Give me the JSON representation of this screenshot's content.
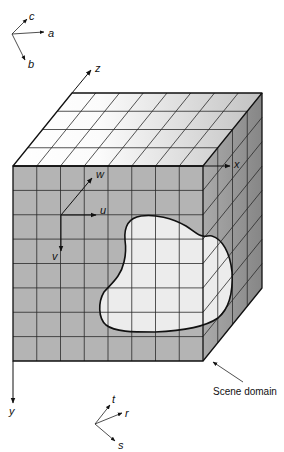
{
  "frames": {
    "abc": {
      "a": "a",
      "b": "b",
      "c": "c"
    },
    "world": {
      "x": "x",
      "y": "y",
      "z": "z"
    },
    "uvw": {
      "u": "u",
      "v": "v",
      "w": "w"
    },
    "rst": {
      "r": "r",
      "s": "s",
      "t": "t"
    }
  },
  "annotation": {
    "scene_domain": "Scene domain"
  },
  "grid": {
    "columns": 8,
    "rows": 8,
    "depth": 4
  },
  "colors": {
    "front_face": "#b4b4b4",
    "top_face_light": "#ffffff",
    "top_face_dark": "#c2c2c2",
    "side_face_light": "#aaaaaa",
    "side_face_dark": "#868686",
    "scene_domain_fill": "#ececec"
  }
}
